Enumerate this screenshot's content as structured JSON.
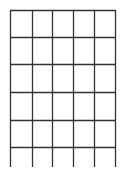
{
  "diagram": {
    "type": "grid",
    "line_color": "#333333",
    "background": "#ffffff",
    "columns": 5,
    "rows": 5,
    "vertical_lines_x": [
      10,
      32,
      52,
      73,
      94,
      115
    ],
    "horizontal_lines_y": [
      10,
      37,
      64,
      92,
      120,
      147
    ],
    "vertical_extent": [
      10,
      167
    ],
    "horizontal_extent": [
      10,
      115
    ]
  }
}
